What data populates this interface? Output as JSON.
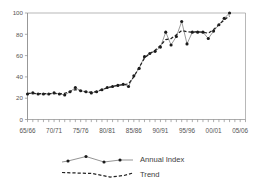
{
  "chart_data": {
    "type": "line",
    "title": "",
    "xlabel": "",
    "ylabel": "",
    "ylim": [
      0,
      100
    ],
    "yticks": [
      0,
      20,
      40,
      60,
      80,
      100
    ],
    "ytick_labels": [
      "0",
      "20",
      "40",
      "60",
      "80",
      "100"
    ],
    "grid": false,
    "legend_position": "bottom",
    "xtick_labels": [
      "65/66",
      "70/71",
      "75/76",
      "80/81",
      "85/86",
      "90/91",
      "95/96",
      "00/01",
      "05/06"
    ],
    "xtick_years": [
      1965,
      1970,
      1975,
      1980,
      1985,
      1990,
      1995,
      2000,
      2005
    ],
    "xlim": [
      1965,
      2006
    ],
    "series": [
      {
        "name": "Annual Index",
        "style": "solid-with-markers",
        "x": [
          1965,
          1966,
          1967,
          1968,
          1969,
          1970,
          1971,
          1972,
          1973,
          1974,
          1975,
          1976,
          1977,
          1978,
          1979,
          1980,
          1981,
          1982,
          1983,
          1984,
          1985,
          1986,
          1987,
          1988,
          1989,
          1990,
          1991,
          1992,
          1993,
          1994,
          1995,
          1996,
          1997,
          1998,
          1999,
          2000,
          2001,
          2002,
          2003
        ],
        "values": [
          24,
          25,
          24,
          24,
          24,
          25,
          24,
          23,
          26,
          30,
          27,
          26,
          25,
          26,
          28,
          30,
          31,
          32,
          33,
          31,
          41,
          48,
          59,
          62,
          64,
          68,
          82,
          70,
          78,
          92,
          71,
          82,
          82,
          82,
          76,
          83,
          89,
          95,
          100
        ]
      },
      {
        "name": "Trend",
        "style": "dashed",
        "x": [
          1965,
          1966,
          1967,
          1968,
          1969,
          1970,
          1971,
          1972,
          1973,
          1974,
          1975,
          1976,
          1977,
          1978,
          1979,
          1980,
          1981,
          1982,
          1983,
          1984,
          1985,
          1986,
          1987,
          1988,
          1989,
          1990,
          1991,
          1992,
          1993,
          1994,
          1995,
          1996,
          1997,
          1998,
          1999,
          2000,
          2001,
          2002,
          2003
        ],
        "values": [
          24.5,
          24.5,
          24.3,
          24.2,
          24.3,
          24.5,
          24.3,
          24.5,
          26.5,
          28.0,
          27.0,
          26.0,
          25.6,
          26.3,
          28.0,
          29.6,
          31.0,
          32.2,
          32.6,
          33.5,
          40.0,
          49.0,
          57.5,
          62.0,
          65.0,
          69.5,
          75.0,
          76.0,
          79.5,
          83.5,
          82.5,
          82.0,
          82.5,
          82.0,
          81.0,
          84.5,
          89.0,
          93.5,
          97.5
        ]
      }
    ]
  },
  "legend": {
    "entries": [
      {
        "label": "Annual Index",
        "style": "solid-with-markers"
      },
      {
        "label": "Trend",
        "style": "dashed"
      }
    ]
  }
}
